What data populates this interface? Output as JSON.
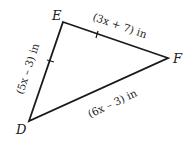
{
  "diagram": {
    "type": "triangle",
    "vertices": [
      {
        "label": "E",
        "x": 63,
        "y": 22
      },
      {
        "label": "F",
        "x": 168,
        "y": 58
      },
      {
        "label": "D",
        "x": 29,
        "y": 121
      }
    ],
    "sides": [
      {
        "from": "D",
        "to": "E",
        "label": "(5x – 3) in",
        "tick_marks": 1
      },
      {
        "from": "E",
        "to": "F",
        "label": "(3x + 7) in",
        "tick_marks": 1
      },
      {
        "from": "D",
        "to": "F",
        "label": "(6x – 3) in",
        "tick_marks": 0
      }
    ],
    "line_color": "#1a1a1a"
  },
  "labels": {
    "vertex_e": "E",
    "vertex_f": "F",
    "vertex_d": "D",
    "side_de": "(5x – 3) in",
    "side_ef": "(3x + 7) in",
    "side_df": "(6x – 3) in"
  }
}
